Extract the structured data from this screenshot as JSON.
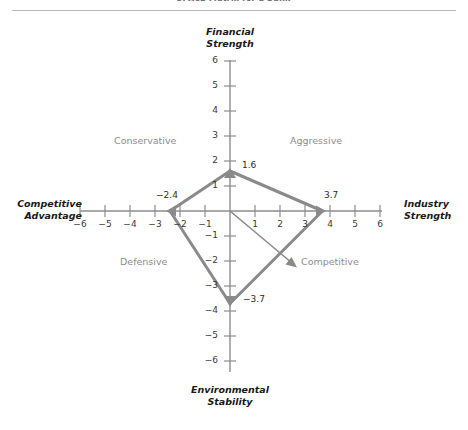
{
  "figure": {
    "clipped_caption": "SPACE Matrix for a Bank",
    "axis_titles": {
      "top": "Financial\nStrength",
      "top_line1": "Financial",
      "top_line2": "Strength",
      "bottom_line1": "Environmental",
      "bottom_line2": "Stability",
      "left_line1": "Competitive",
      "left_line2": "Advantage",
      "right_line1": "Industry",
      "right_line2": "Strength"
    },
    "quadrants": {
      "upper_left": "Conservative",
      "upper_right": "Aggressive",
      "lower_left": "Defensive",
      "lower_right": "Competitive"
    },
    "colors": {
      "axis": "#8d8d8d",
      "polygon": "#8a8a8a",
      "vector": "#8a8a8a",
      "quadrant_text": "#8c8c8c",
      "tick_text": "#3a3a3a",
      "title_text": "#1a1a1a",
      "rule": "#b9b9b9"
    }
  },
  "chart_data": {
    "type": "scatter",
    "title": "SPACE Matrix for a Bank",
    "xlabel": "Competitive Advantage  /  Industry Strength",
    "ylabel": "Financial Strength  /  Environmental Stability",
    "xlim": [
      -6,
      6
    ],
    "ylim": [
      -6,
      6
    ],
    "grid": false,
    "legend": "none",
    "x_ticks": [
      "-6",
      "-5",
      "-4",
      "-3",
      "-2",
      "-1",
      "1",
      "2",
      "3",
      "4",
      "5",
      "6"
    ],
    "x_tick_values": [
      -6,
      -5,
      -4,
      -3,
      -2,
      -1,
      1,
      2,
      3,
      4,
      5,
      6
    ],
    "y_ticks": [
      "6",
      "5",
      "4",
      "3",
      "2",
      "1",
      "-1",
      "-2",
      "-3",
      "-4",
      "-5",
      "-6"
    ],
    "y_tick_values": [
      6,
      5,
      4,
      3,
      2,
      1,
      -1,
      -2,
      -3,
      -4,
      -5,
      -6
    ],
    "axis_names": {
      "positive_y": "Financial Strength",
      "negative_y": "Environmental Stability",
      "negative_x": "Competitive Advantage",
      "positive_x": "Industry Strength"
    },
    "quadrant_names": {
      "upper_left": "Conservative",
      "upper_right": "Aggressive",
      "lower_left": "Defensive",
      "lower_right": "Competitive"
    },
    "points": [
      {
        "name": "financial-strength",
        "label": "1.6",
        "axis": "y-positive",
        "x": 0,
        "y": 1.6
      },
      {
        "name": "industry-strength",
        "label": "3.7",
        "axis": "x-positive",
        "x": 3.7,
        "y": 0
      },
      {
        "name": "environmental-stability",
        "label": "-3.7",
        "axis": "y-negative",
        "x": 0,
        "y": -3.7
      },
      {
        "name": "competitive-advantage",
        "label": "-2.4",
        "axis": "x-negative",
        "x": -2.4,
        "y": 0
      }
    ],
    "polygon": [
      [
        0,
        1.6
      ],
      [
        3.7,
        0
      ],
      [
        0,
        -3.7
      ],
      [
        -2.4,
        0
      ]
    ],
    "directional_vector": {
      "from": [
        0,
        0
      ],
      "to": [
        2.6,
        -2.1
      ],
      "x_sum": 1.3,
      "y_sum": -2.1,
      "quadrant": "Competitive"
    }
  }
}
